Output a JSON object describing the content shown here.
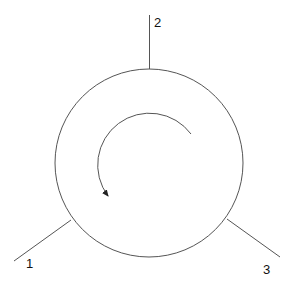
{
  "diagram": {
    "type": "circulator",
    "ports": [
      {
        "label": "1",
        "position": "lower-left"
      },
      {
        "label": "2",
        "position": "top"
      },
      {
        "label": "3",
        "position": "lower-right"
      }
    ],
    "rotation_direction": "counterclockwise",
    "colors": {
      "stroke": "#555555",
      "text": "#111111",
      "background": "#ffffff"
    }
  }
}
